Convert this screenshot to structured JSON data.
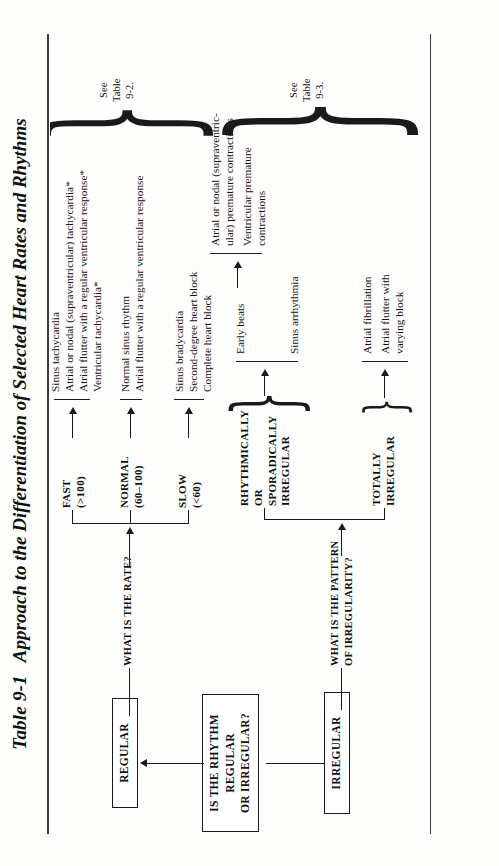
{
  "table": {
    "number": "Table 9-1",
    "title": "Approach to the Differentiation of Selected Heart Rates and Rhythms"
  },
  "root": {
    "label": "IS THE RHYTHM\nREGULAR\nOR IRREGULAR?",
    "line1": "IS THE RHYTHM",
    "line2": "REGULAR",
    "line3": "OR IRREGULAR?"
  },
  "branches": [
    {
      "id": "regular",
      "box_label": "REGULAR",
      "question": "WHAT IS THE RATE?",
      "see_ref": {
        "line1": "See",
        "line2": "Table",
        "line3": "9-2."
      },
      "groups": [
        {
          "label_line1": "FAST",
          "label_line2": "(>100)",
          "items": [
            "Sinus tachycardia",
            "Atrial or nodal (supraventricular) tachycardia*",
            "Atrial flutter with a regular ventricular response*",
            "Ventricular tachycardia*"
          ]
        },
        {
          "label_line1": "NORMAL",
          "label_line2": "(60–100)",
          "items": [
            "Normal sinus rhythm",
            "Atrial flutter with a regular ventricular response"
          ]
        },
        {
          "label_line1": "SLOW",
          "label_line2": "(<60)",
          "items": [
            "Sinus bradycardia",
            "Second-degree heart block",
            "Complete heart block"
          ]
        }
      ]
    },
    {
      "id": "irregular",
      "box_label": "IRREGULAR",
      "question_line1": "WHAT IS THE PATTERN",
      "question_line2": "OF IRREGULARITY?",
      "see_ref": {
        "line1": "See",
        "line2": "Table",
        "line3": "9-3."
      },
      "groups": [
        {
          "label_line1": "RHYTHMICALLY",
          "label_line2": "OR",
          "label_line3": "SPORADICALLY",
          "label_line4": "IRREGULAR",
          "sub": [
            {
              "label": "Early beats",
              "items": [
                "Atrial or nodal (supraventric-\nular) premature contractions",
                "Ventricular premature\ncontractions"
              ]
            },
            {
              "label": "Sinus arrhythmia",
              "items": []
            }
          ]
        },
        {
          "label_line1": "TOTALLY",
          "label_line2": "IRREGULAR",
          "items": [
            "Atrial fibrillation",
            "Atrial flutter with\nvarying block"
          ]
        }
      ]
    }
  ],
  "colors": {
    "ink": "#1a1a1a",
    "rule": "#3a3a3a",
    "paper": "#fdfdfc"
  }
}
